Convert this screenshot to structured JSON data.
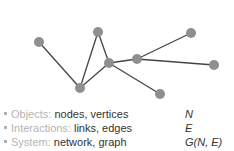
{
  "diagram": {
    "node_color": "#8f8f8f",
    "edge_color": "#444444",
    "nodes": [
      {
        "id": "A",
        "x": 39,
        "y": 42
      },
      {
        "id": "B",
        "x": 98,
        "y": 32
      },
      {
        "id": "C",
        "x": 109,
        "y": 63
      },
      {
        "id": "D",
        "x": 137,
        "y": 59
      },
      {
        "id": "E",
        "x": 191,
        "y": 33
      },
      {
        "id": "F",
        "x": 214,
        "y": 65
      },
      {
        "id": "G",
        "x": 80,
        "y": 88
      },
      {
        "id": "H",
        "x": 160,
        "y": 94
      }
    ],
    "edges": [
      [
        "A",
        "G"
      ],
      [
        "G",
        "B"
      ],
      [
        "B",
        "C"
      ],
      [
        "G",
        "C"
      ],
      [
        "C",
        "D"
      ],
      [
        "D",
        "E"
      ],
      [
        "D",
        "F"
      ],
      [
        "C",
        "H"
      ]
    ]
  },
  "legend": [
    {
      "label": "Objects:",
      "value": "nodes, vertices",
      "symbol": "N"
    },
    {
      "label": "Interactions:",
      "value": "links, edges",
      "symbol": "E"
    },
    {
      "label": "System:",
      "value": "network, graph",
      "symbol": "G(N, E)"
    }
  ]
}
